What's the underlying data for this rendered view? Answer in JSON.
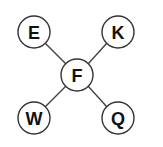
{
  "diagram": {
    "center": {
      "label": "F",
      "cx": 77,
      "cy": 75,
      "r": 16
    },
    "nodes": [
      {
        "label": "E",
        "cx": 34,
        "cy": 32,
        "r": 16
      },
      {
        "label": "K",
        "cx": 118,
        "cy": 32,
        "r": 16
      },
      {
        "label": "W",
        "cx": 34,
        "cy": 118,
        "r": 16
      },
      {
        "label": "Q",
        "cx": 118,
        "cy": 118,
        "r": 16
      }
    ],
    "edges": [
      [
        "F",
        "E"
      ],
      [
        "F",
        "K"
      ],
      [
        "F",
        "W"
      ],
      [
        "F",
        "Q"
      ]
    ],
    "colors": {
      "stroke": "#333333",
      "fill": "#ffffff",
      "text": "#111111"
    }
  }
}
